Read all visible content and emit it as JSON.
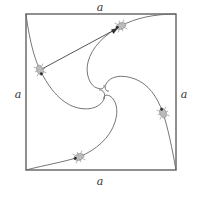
{
  "diagram": {
    "side_labels": {
      "top": "a",
      "bottom": "a",
      "left": "a",
      "right": "a"
    },
    "square": {
      "x": 26,
      "y": 14,
      "width": 150,
      "height": 156,
      "stroke": "#555555"
    },
    "curve_color": "#666666",
    "bug_color": "#444444",
    "bugs": [
      {
        "name": "bug-left",
        "x": 40,
        "y": 70
      },
      {
        "name": "bug-top",
        "x": 121,
        "y": 26
      },
      {
        "name": "bug-right",
        "x": 163,
        "y": 113
      },
      {
        "name": "bug-bottom",
        "x": 79,
        "y": 157
      }
    ],
    "chase_line": {
      "from": "bug-left",
      "to": "bug-top"
    },
    "center": {
      "x": 103,
      "y": 92
    }
  }
}
